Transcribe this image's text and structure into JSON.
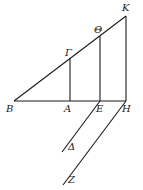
{
  "diagram": {
    "type": "geometric-figure",
    "points": {
      "B": {
        "label": "B",
        "x": 14,
        "y": 101
      },
      "A": {
        "label": "A",
        "x": 70,
        "y": 101
      },
      "E": {
        "label": "E",
        "x": 100,
        "y": 101
      },
      "H": {
        "label": "H",
        "x": 126,
        "y": 101
      },
      "G": {
        "label": "Γ",
        "x": 70,
        "y": 58
      },
      "Th": {
        "label": "Θ",
        "x": 100,
        "y": 36
      },
      "K": {
        "label": "K",
        "x": 126,
        "y": 16
      },
      "D": {
        "label": "Δ",
        "x": 62,
        "y": 150
      },
      "Z": {
        "label": "Z",
        "x": 64,
        "y": 183
      }
    },
    "segments": [
      [
        "B",
        "H"
      ],
      [
        "B",
        "K"
      ],
      [
        "A",
        "G"
      ],
      [
        "E",
        "Th"
      ],
      [
        "H",
        "K"
      ],
      [
        "E",
        "D"
      ],
      [
        "H",
        "Z"
      ]
    ]
  }
}
